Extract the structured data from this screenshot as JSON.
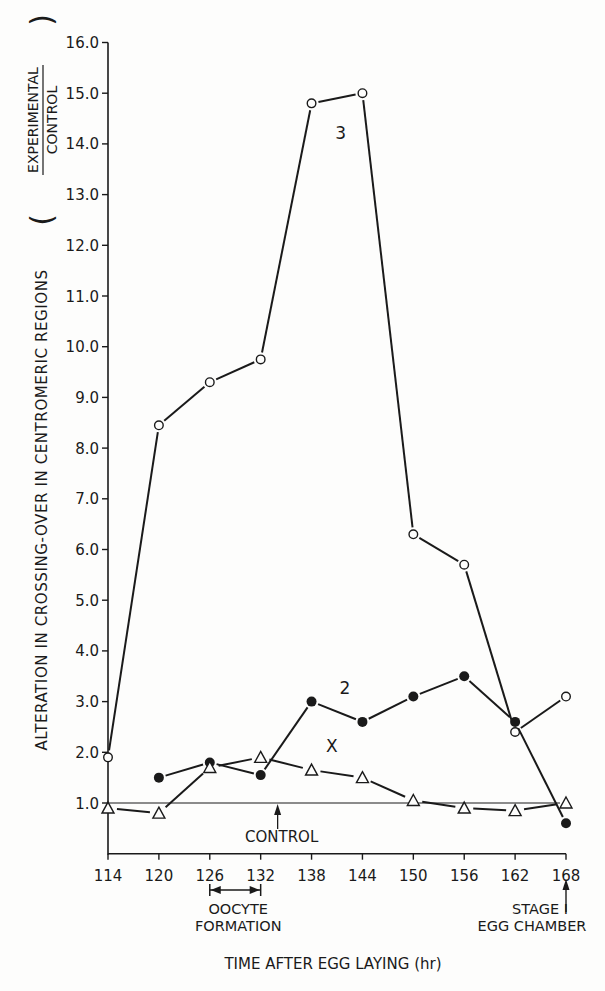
{
  "chart_data": {
    "type": "line",
    "title": "",
    "xlabel": "TIME AFTER EGG LAYING (hr)",
    "ylabel": "ALTERATION IN CROSSING-OVER IN CENTROMERIC REGIONS",
    "ylabel_fraction": {
      "numerator": "EXPERIMENTAL",
      "denominator": "CONTROL"
    },
    "x": [
      114,
      120,
      126,
      132,
      138,
      144,
      150,
      156,
      162,
      168
    ],
    "x_ticks": [
      "114",
      "120",
      "126",
      "132",
      "138",
      "144",
      "150",
      "156",
      "162",
      "168"
    ],
    "y_ticks": [
      "1.0",
      "2.0",
      "3.0",
      "4.0",
      "5.0",
      "6.0",
      "7.0",
      "8.0",
      "9.0",
      "10.0",
      "11.0",
      "12.0",
      "13.0",
      "14.0",
      "15.0",
      "16.0"
    ],
    "ylim": [
      0.0,
      16.0
    ],
    "xlim": [
      114,
      168
    ],
    "grid": false,
    "legend": "inline labels",
    "series": [
      {
        "name": "3",
        "marker": "open-circle",
        "x": [
          114,
          120,
          126,
          132,
          138,
          144,
          150,
          156,
          162,
          168
        ],
        "values": [
          1.9,
          8.45,
          9.3,
          9.75,
          14.8,
          15.0,
          6.3,
          5.7,
          2.4,
          3.1
        ]
      },
      {
        "name": "2",
        "marker": "filled-circle",
        "x": [
          120,
          126,
          132,
          138,
          144,
          150,
          156,
          162,
          168
        ],
        "values": [
          1.5,
          1.8,
          1.55,
          3.0,
          2.6,
          3.1,
          3.5,
          2.6,
          0.6
        ]
      },
      {
        "name": "X",
        "marker": "open-triangle",
        "x": [
          114,
          120,
          126,
          132,
          138,
          144,
          150,
          156,
          162,
          168
        ],
        "values": [
          0.9,
          0.8,
          1.7,
          1.9,
          1.65,
          1.5,
          1.05,
          0.9,
          0.85,
          1.0
        ]
      }
    ],
    "reference_line": {
      "label": "CONTROL",
      "value": 1.0
    },
    "annotations": [
      {
        "text_lines": [
          "OOCYTE",
          "FORMATION"
        ],
        "range": [
          126,
          132
        ],
        "type": "double-arrow"
      },
      {
        "text_lines": [
          "STAGE I",
          "EGG CHAMBER"
        ],
        "at": 168,
        "type": "up-arrow"
      }
    ]
  }
}
